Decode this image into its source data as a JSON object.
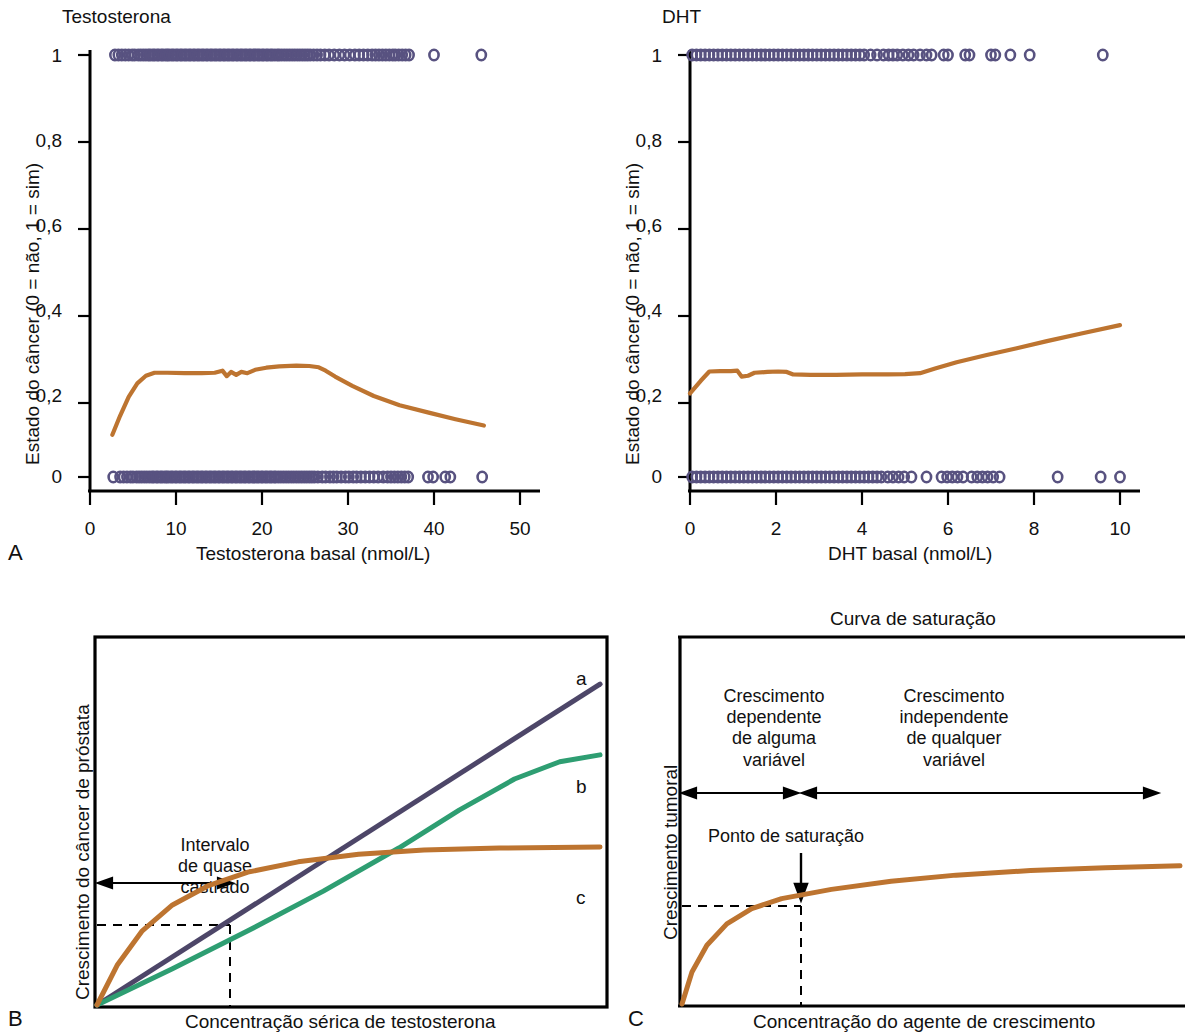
{
  "figure": {
    "panels": [
      "A",
      "B",
      "C"
    ]
  },
  "panelA": {
    "letter": "A",
    "title": "Testosterona",
    "xlabel": "Testosterona basal (nmol/L)",
    "ylabel": "Estado do câncer (0 = não, 1 = sim)",
    "xticks": [
      "0",
      "10",
      "20",
      "30",
      "40",
      "50"
    ],
    "yticks": [
      "0",
      "0,2",
      "0,4",
      "0,6",
      "0,8",
      "1"
    ]
  },
  "panelB_top": {
    "letter": "",
    "title": "DHT",
    "xlabel": "DHT basal (nmol/L)",
    "ylabel": "Estado do câncer (0 = não, 1 = sim)",
    "xticks": [
      "0",
      "2",
      "4",
      "6",
      "8",
      "10"
    ],
    "yticks": [
      "0",
      "0,2",
      "0,4",
      "0,6",
      "0,8",
      "1"
    ]
  },
  "panelB": {
    "letter": "B",
    "xlabel": "Concentração sérica de testosterona",
    "ylabel": "Crescimento do câncer de próstata",
    "annotation": "Intervalo\nde quase\ncastrado",
    "curve_labels": [
      "a",
      "b",
      "c"
    ]
  },
  "panelC": {
    "letter": "C",
    "title": "Curva de saturação",
    "xlabel": "Concentração do agente de crescimento",
    "ylabel": "Crescimento tumoral",
    "region_left": "Crescimento\ndependente\nde alguma\nvariável",
    "region_right": "Crescimento\nindependente\nde qualquer\nvariável",
    "saturation_label": "Ponto de saturação"
  },
  "colors": {
    "marker": "#585280",
    "orange": "#bd7430",
    "purple": "#4d4668",
    "green": "#2e9e72",
    "axis": "#000000",
    "text": "#111111"
  },
  "chart_data": [
    {
      "type": "scatter",
      "id": "panelA",
      "title": "Testosterona",
      "xlabel": "Testosterona basal (nmol/L)",
      "ylabel": "Estado do câncer (0 = não, 1 = sim)",
      "xlim": [
        0,
        50
      ],
      "ylim": [
        0,
        1
      ],
      "xticks": [
        0,
        10,
        20,
        30,
        40,
        50
      ],
      "yticks": [
        0,
        0.2,
        0.4,
        0.6,
        0.8,
        1
      ],
      "grid": false,
      "legend": "none",
      "series": [
        {
          "name": "cancer = 1 (sim)",
          "type": "rug-scatter",
          "y": 1,
          "x": [
            2.9,
            3.3,
            3.7,
            4.1,
            4.5,
            4.9,
            5.2,
            5.6,
            5.9,
            6.2,
            6.5,
            6.8,
            7.0,
            7.3,
            7.5,
            7.8,
            8.0,
            8.3,
            8.5,
            8.8,
            9.0,
            9.2,
            9.5,
            9.7,
            10.0,
            10.2,
            10.5,
            10.7,
            11.0,
            11.2,
            11.5,
            11.7,
            12.0,
            12.2,
            12.5,
            12.7,
            13.0,
            13.2,
            13.5,
            13.7,
            14.0,
            14.2,
            14.5,
            14.7,
            15.0,
            15.2,
            15.5,
            15.7,
            16.0,
            16.2,
            16.5,
            16.7,
            17.0,
            17.2,
            17.5,
            17.7,
            18.0,
            18.2,
            18.5,
            18.7,
            19.0,
            19.2,
            19.5,
            19.7,
            20.0,
            20.2,
            20.5,
            20.7,
            21.0,
            21.2,
            21.5,
            21.8,
            22.0,
            22.3,
            22.6,
            22.9,
            23.2,
            23.5,
            23.8,
            24.1,
            24.4,
            24.7,
            25.0,
            25.3,
            25.6,
            26.0,
            26.4,
            26.8,
            27.3,
            27.8,
            28.4,
            29.0,
            29.6,
            30.2,
            30.8,
            31.3,
            31.8,
            32.3,
            32.8,
            33.2,
            33.6,
            34.0,
            34.4,
            34.8,
            35.2,
            35.5,
            35.9,
            36.3,
            36.7,
            37.1,
            40.0,
            45.5
          ]
        },
        {
          "name": "cancer = 0 (não)",
          "type": "rug-scatter",
          "y": 0,
          "x": [
            2.7,
            3.5,
            3.9,
            4.3,
            4.7,
            5.0,
            5.4,
            5.7,
            6.0,
            6.3,
            6.6,
            6.9,
            7.2,
            7.4,
            7.7,
            7.9,
            8.2,
            8.4,
            8.7,
            8.9,
            9.1,
            9.4,
            9.6,
            9.9,
            10.1,
            10.4,
            10.6,
            10.9,
            11.1,
            11.4,
            11.6,
            11.9,
            12.1,
            12.4,
            12.6,
            12.9,
            13.1,
            13.4,
            13.6,
            13.9,
            14.1,
            14.4,
            14.6,
            14.9,
            15.1,
            15.4,
            15.6,
            15.9,
            16.1,
            16.4,
            16.6,
            16.9,
            17.1,
            17.4,
            17.6,
            17.9,
            18.1,
            18.4,
            18.6,
            18.9,
            19.1,
            19.4,
            19.6,
            19.9,
            20.1,
            20.4,
            20.6,
            20.9,
            21.1,
            21.4,
            21.6,
            21.9,
            22.2,
            22.5,
            22.8,
            23.1,
            23.4,
            23.7,
            24.0,
            24.3,
            24.6,
            24.9,
            25.2,
            25.5,
            25.8,
            26.1,
            26.5,
            27.0,
            27.4,
            27.9,
            28.3,
            28.7,
            29.2,
            29.7,
            30.1,
            30.6,
            31.0,
            31.5,
            32.0,
            32.5,
            33.0,
            33.5,
            34.1,
            34.6,
            35.0,
            35.4,
            35.8,
            36.2,
            36.6,
            37.0,
            39.3,
            39.9,
            41.3,
            41.9,
            45.6
          ]
        },
        {
          "name": "probabilidade ajustada",
          "type": "line",
          "color": "#bd7430",
          "points": [
            [
              2.6,
              0.1
            ],
            [
              3.5,
              0.145
            ],
            [
              4.5,
              0.19
            ],
            [
              5.5,
              0.222
            ],
            [
              6.5,
              0.24
            ],
            [
              7.5,
              0.247
            ],
            [
              9.0,
              0.247
            ],
            [
              11.0,
              0.246
            ],
            [
              13.0,
              0.246
            ],
            [
              14.5,
              0.247
            ],
            [
              15.4,
              0.252
            ],
            [
              15.9,
              0.239
            ],
            [
              16.4,
              0.249
            ],
            [
              17.0,
              0.242
            ],
            [
              17.6,
              0.249
            ],
            [
              18.3,
              0.246
            ],
            [
              19.2,
              0.254
            ],
            [
              20.5,
              0.259
            ],
            [
              22.0,
              0.262
            ],
            [
              24.0,
              0.264
            ],
            [
              25.5,
              0.263
            ],
            [
              26.6,
              0.26
            ],
            [
              27.4,
              0.252
            ],
            [
              28.5,
              0.238
            ],
            [
              30.5,
              0.216
            ],
            [
              33.0,
              0.192
            ],
            [
              36.0,
              0.17
            ],
            [
              39.5,
              0.152
            ],
            [
              42.5,
              0.137
            ],
            [
              45.8,
              0.122
            ]
          ]
        }
      ]
    },
    {
      "type": "scatter",
      "id": "panelA-DHT",
      "title": "DHT",
      "xlabel": "DHT basal (nmol/L)",
      "ylabel": "Estado do câncer (0 = não, 1 = sim)",
      "xlim": [
        0,
        10
      ],
      "ylim": [
        0,
        1
      ],
      "xticks": [
        0,
        2,
        4,
        6,
        8,
        10
      ],
      "yticks": [
        0,
        0.2,
        0.4,
        0.6,
        0.8,
        1
      ],
      "grid": false,
      "legend": "none",
      "series": [
        {
          "name": "cancer = 1 (sim)",
          "type": "rug-scatter",
          "y": 1,
          "x": [
            0.05,
            0.15,
            0.25,
            0.35,
            0.45,
            0.55,
            0.65,
            0.75,
            0.85,
            0.95,
            1.05,
            1.15,
            1.25,
            1.35,
            1.45,
            1.55,
            1.65,
            1.75,
            1.85,
            1.95,
            2.05,
            2.15,
            2.25,
            2.35,
            2.45,
            2.55,
            2.65,
            2.75,
            2.85,
            2.95,
            3.05,
            3.15,
            3.25,
            3.35,
            3.45,
            3.55,
            3.65,
            3.75,
            3.85,
            3.95,
            4.05,
            4.2,
            4.35,
            4.5,
            4.62,
            4.72,
            4.82,
            4.95,
            5.08,
            5.2,
            5.35,
            5.5,
            5.62,
            5.9,
            6.0,
            6.4,
            6.5,
            7.0,
            7.1,
            7.45,
            7.9,
            9.6
          ]
        },
        {
          "name": "cancer = 0 (não)",
          "type": "rug-scatter",
          "y": 0,
          "x": [
            0.05,
            0.15,
            0.25,
            0.35,
            0.45,
            0.55,
            0.65,
            0.75,
            0.85,
            0.95,
            1.05,
            1.15,
            1.25,
            1.35,
            1.45,
            1.55,
            1.65,
            1.75,
            1.85,
            1.95,
            2.05,
            2.15,
            2.25,
            2.35,
            2.45,
            2.55,
            2.65,
            2.75,
            2.85,
            2.95,
            3.05,
            3.15,
            3.25,
            3.35,
            3.45,
            3.55,
            3.65,
            3.75,
            3.85,
            3.95,
            4.05,
            4.15,
            4.25,
            4.35,
            4.45,
            4.6,
            4.72,
            4.85,
            4.98,
            5.15,
            5.5,
            5.85,
            5.98,
            6.1,
            6.22,
            6.35,
            6.55,
            6.68,
            6.8,
            6.92,
            7.05,
            7.2,
            8.55,
            9.55,
            10.0
          ]
        },
        {
          "name": "probabilidade ajustada",
          "type": "line",
          "color": "#bd7430",
          "points": [
            [
              0.0,
              0.198
            ],
            [
              0.25,
              0.228
            ],
            [
              0.45,
              0.25
            ],
            [
              0.7,
              0.251
            ],
            [
              0.95,
              0.251
            ],
            [
              1.1,
              0.252
            ],
            [
              1.2,
              0.238
            ],
            [
              1.35,
              0.24
            ],
            [
              1.5,
              0.247
            ],
            [
              1.8,
              0.249
            ],
            [
              2.05,
              0.25
            ],
            [
              2.25,
              0.249
            ],
            [
              2.4,
              0.243
            ],
            [
              2.8,
              0.242
            ],
            [
              3.4,
              0.242
            ],
            [
              4.0,
              0.243
            ],
            [
              4.6,
              0.243
            ],
            [
              5.0,
              0.244
            ],
            [
              5.35,
              0.246
            ],
            [
              5.7,
              0.257
            ],
            [
              6.2,
              0.272
            ],
            [
              6.9,
              0.289
            ],
            [
              7.6,
              0.305
            ],
            [
              8.3,
              0.322
            ],
            [
              9.1,
              0.34
            ],
            [
              10.0,
              0.36
            ]
          ]
        }
      ]
    },
    {
      "type": "line",
      "id": "panelB",
      "title": "",
      "xlabel": "Concentração sérica de testosterona",
      "ylabel": "Crescimento do câncer de próstata",
      "xlim": [
        0,
        1
      ],
      "ylim": [
        0,
        1
      ],
      "grid": false,
      "legend": "inline-right",
      "annotations": [
        "Intervalo de quase castrado"
      ],
      "series": [
        {
          "name": "a",
          "color": "#4d4668",
          "shape": "linear",
          "points": [
            [
              0.0,
              0.0
            ],
            [
              1.0,
              0.93
            ]
          ]
        },
        {
          "name": "b",
          "color": "#2e9e72",
          "shape": "sigmoid-saturating",
          "points": [
            [
              0.0,
              0.0
            ],
            [
              0.15,
              0.105
            ],
            [
              0.3,
              0.215
            ],
            [
              0.45,
              0.33
            ],
            [
              0.6,
              0.455
            ],
            [
              0.72,
              0.565
            ],
            [
              0.83,
              0.655
            ],
            [
              0.92,
              0.705
            ],
            [
              1.0,
              0.725
            ]
          ]
        },
        {
          "name": "c",
          "color": "#bd7430",
          "shape": "saturating",
          "points": [
            [
              0.0,
              0.0
            ],
            [
              0.04,
              0.115
            ],
            [
              0.09,
              0.215
            ],
            [
              0.15,
              0.29
            ],
            [
              0.22,
              0.345
            ],
            [
              0.3,
              0.385
            ],
            [
              0.4,
              0.415
            ],
            [
              0.52,
              0.437
            ],
            [
              0.65,
              0.449
            ],
            [
              0.8,
              0.455
            ],
            [
              1.0,
              0.458
            ]
          ]
        }
      ]
    },
    {
      "type": "line",
      "id": "panelC",
      "title": "Curva de saturação",
      "xlabel": "Concentração do agente de crescimento",
      "ylabel": "Crescimento tumoral",
      "xlim": [
        0,
        1
      ],
      "ylim": [
        0,
        1
      ],
      "grid": false,
      "legend": "none",
      "annotations": [
        "Crescimento dependente de alguma variável",
        "Crescimento independente de qualquer variável",
        "Ponto de saturação"
      ],
      "saturation_point": [
        0.3,
        0.32
      ],
      "series": [
        {
          "name": "saturação",
          "color": "#bd7430",
          "points": [
            [
              0.0,
              0.0
            ],
            [
              0.02,
              0.09
            ],
            [
              0.05,
              0.165
            ],
            [
              0.09,
              0.225
            ],
            [
              0.14,
              0.268
            ],
            [
              0.2,
              0.296
            ],
            [
              0.3,
              0.322
            ],
            [
              0.42,
              0.345
            ],
            [
              0.55,
              0.362
            ],
            [
              0.7,
              0.375
            ],
            [
              0.85,
              0.383
            ],
            [
              1.0,
              0.388
            ]
          ]
        }
      ]
    }
  ]
}
